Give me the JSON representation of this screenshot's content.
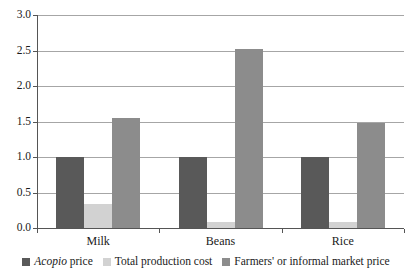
{
  "chart_data": {
    "type": "bar",
    "title": "",
    "subtitle": "",
    "xlabel": "",
    "ylabel": "",
    "categories": [
      "Milk",
      "Beans",
      "Rice"
    ],
    "series": [
      {
        "name": "Acopio price",
        "name_italic_prefix": "Acopio",
        "name_rest": " price",
        "color": "#595959",
        "values": [
          1.0,
          1.0,
          1.0
        ]
      },
      {
        "name": "Total production cost",
        "color": "#d2d2d2",
        "values": [
          0.34,
          0.08,
          0.08
        ]
      },
      {
        "name": "Farmers' or informal market price",
        "color": "#8c8c8c",
        "values": [
          1.55,
          2.52,
          1.48
        ]
      }
    ],
    "ylim": [
      0.0,
      3.0
    ],
    "yticks": [
      0.0,
      0.5,
      1.0,
      1.5,
      2.0,
      2.5,
      3.0
    ],
    "ytick_labels": [
      "0.0",
      "0.5",
      "1.0",
      "1.5",
      "2.0",
      "2.5",
      "3.0"
    ],
    "grid": true,
    "grid_axis": "y",
    "legend_position": "bottom",
    "background": "#ffffff",
    "axis_color": "#555555",
    "grid_color": "#a6a6a6"
  }
}
